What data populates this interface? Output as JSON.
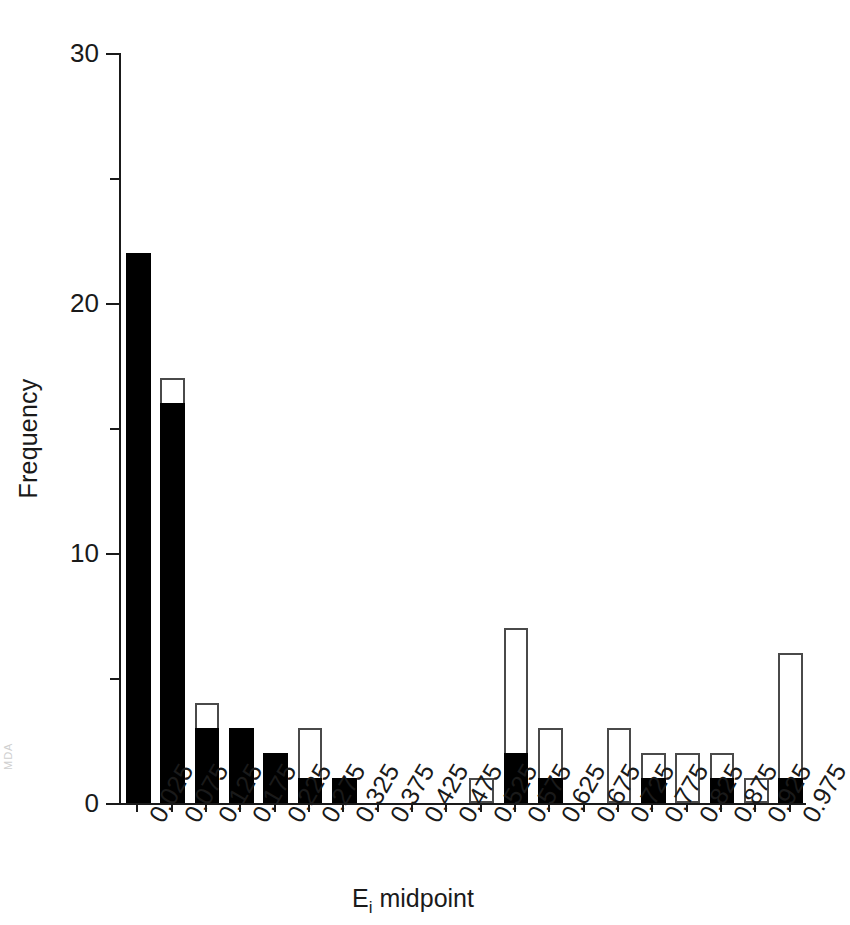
{
  "chart_data": {
    "type": "bar",
    "title": "",
    "subtitle": "",
    "xlabel": "Eᵢ midpoint",
    "xlabel_base": "E",
    "xlabel_sub": "i",
    "xlabel_rest": " midpoint",
    "ylabel": "Frequency",
    "ylim": [
      0,
      30
    ],
    "yticks": [
      0,
      10,
      20,
      30
    ],
    "ytick_labels": [
      "0",
      "10",
      "20",
      "30"
    ],
    "yminor_ticks": [
      5,
      15,
      25
    ],
    "grid": false,
    "legend": "none",
    "stacked": true,
    "bar_style": {
      "filled_color": "#000000",
      "open_fill": "#ffffff",
      "open_border": "#4a4a4a"
    },
    "categories": [
      "0.025",
      "0.075",
      "0.125",
      "0.175",
      "0.225",
      "0.275",
      "0.325",
      "0.375",
      "0.425",
      "0.475",
      "0.525",
      "0.575",
      "0.625",
      "0.675",
      "0.725",
      "0.775",
      "0.825",
      "0.875",
      "0.925",
      "0.975"
    ],
    "series": [
      {
        "name": "filled",
        "values": [
          22,
          16,
          3,
          3,
          2,
          1,
          1,
          0,
          0,
          0,
          0,
          2,
          1,
          0,
          0,
          1,
          0,
          1,
          0,
          1
        ]
      },
      {
        "name": "total",
        "values": [
          22,
          17,
          4,
          3,
          2,
          3,
          1,
          0,
          0,
          0,
          1,
          7,
          3,
          0,
          3,
          2,
          2,
          2,
          1,
          6
        ]
      }
    ]
  },
  "scan": {
    "margin_artifact": "MDA"
  }
}
